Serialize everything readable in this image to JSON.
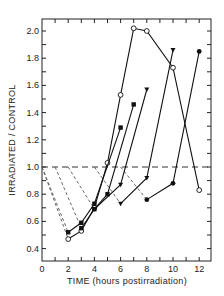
{
  "chart_data": {
    "type": "line",
    "title": "",
    "xlabel": "TIME (hours postirradiation)",
    "ylabel": "IRRADIATED / CONTROL",
    "xlim": [
      0,
      13
    ],
    "ylim": [
      0.3,
      2.1
    ],
    "x_ticks": [
      0,
      2,
      4,
      6,
      8,
      10,
      12
    ],
    "x_tick_labels": [
      "0",
      "2",
      "4",
      "6",
      "8",
      "10",
      "12"
    ],
    "y_ticks": [
      0.4,
      0.6,
      0.8,
      1.0,
      1.2,
      1.4,
      1.6,
      1.8,
      2.0
    ],
    "y_tick_labels": [
      "0.4",
      "0.6",
      "0.8",
      "1.0",
      "1.2",
      "1.4",
      "1.6",
      "1.8",
      "2.0"
    ],
    "grid": false,
    "legend": null,
    "reference_line": {
      "y": 1.0,
      "style": "dashed"
    },
    "series": [
      {
        "name": "series-open-circles",
        "marker": "open-circle",
        "x": [
          2,
          3,
          4,
          5,
          6,
          7,
          8,
          10,
          12
        ],
        "y": [
          0.47,
          0.53,
          0.7,
          1.03,
          1.53,
          2.02,
          2.0,
          1.73,
          0.83
        ],
        "drop_from_x": 0
      },
      {
        "name": "series-filled-a",
        "marker": "filled-square",
        "x": [
          2,
          3,
          4,
          6
        ],
        "y": [
          0.52,
          0.59,
          0.73,
          1.29
        ],
        "drop_from_x": 0
      },
      {
        "name": "series-filled-b",
        "marker": "filled-square",
        "x": [
          3,
          4,
          5,
          7
        ],
        "y": [
          0.55,
          0.69,
          0.8,
          1.46
        ],
        "drop_from_x": 1
      },
      {
        "name": "series-filled-c",
        "marker": "filled-triangle",
        "x": [
          4,
          6,
          8
        ],
        "y": [
          0.69,
          0.87,
          1.57
        ],
        "drop_from_x": 2
      },
      {
        "name": "series-filled-d",
        "marker": "filled-triangle",
        "x": [
          6,
          8,
          10
        ],
        "y": [
          0.73,
          0.92,
          1.86
        ],
        "drop_from_x": 4
      },
      {
        "name": "series-filled-e",
        "marker": "filled-circle",
        "x": [
          8,
          10,
          12
        ],
        "y": [
          0.76,
          0.88,
          1.85
        ],
        "drop_from_x": 6
      }
    ]
  }
}
